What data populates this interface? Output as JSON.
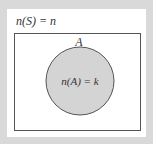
{
  "diagram": {
    "type": "venn",
    "universe_label": "n(S) = n",
    "set_name": "A",
    "set_label": "n(A) = k",
    "colors": {
      "background": "#d9d9d9",
      "panel": "#ffffff",
      "box_stroke": "#555555",
      "circle_fill": "#d4d4d4",
      "circle_stroke": "#555555"
    }
  }
}
